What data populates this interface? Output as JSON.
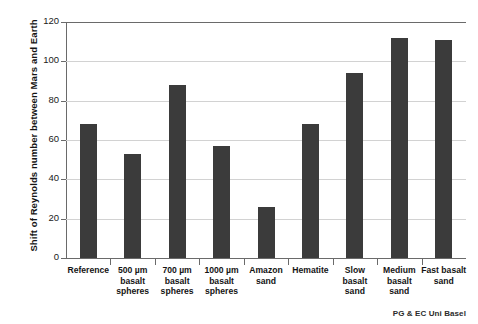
{
  "chart_data": {
    "type": "bar",
    "title": "",
    "xlabel": "",
    "ylabel": "Shift of Reynolds number between Mars and Earth",
    "ylim": [
      0,
      120
    ],
    "yticks": [
      0,
      20,
      40,
      60,
      80,
      100,
      120
    ],
    "grid": true,
    "legend": "none",
    "bar_color": "#3b3b3b",
    "gridline_color": "#d2d2d2",
    "axis_color": "#6a6a6a",
    "categories": [
      "Reference",
      "500 µm basalt spheres",
      "700 µm basalt spheres",
      "1000 µm basalt spheres",
      "Amazon sand",
      "Hematite",
      "Slow basalt sand",
      "Medium basalt sand",
      "Fast basalt sand"
    ],
    "category_lines": [
      [
        "Reference"
      ],
      [
        "500 µm",
        "basalt",
        "spheres"
      ],
      [
        "700 µm",
        "basalt",
        "spheres"
      ],
      [
        "1000 µm",
        "basalt",
        "spheres"
      ],
      [
        "Amazon",
        "sand"
      ],
      [
        "Hematite"
      ],
      [
        "Slow",
        "basalt",
        "sand"
      ],
      [
        "Medium",
        "basalt",
        "sand"
      ],
      [
        "Fast basalt",
        "sand"
      ]
    ],
    "values": [
      68,
      53,
      88,
      57,
      26,
      68,
      94,
      112,
      111
    ]
  },
  "footer": {
    "credit": "PG & EC Uni Basel"
  }
}
